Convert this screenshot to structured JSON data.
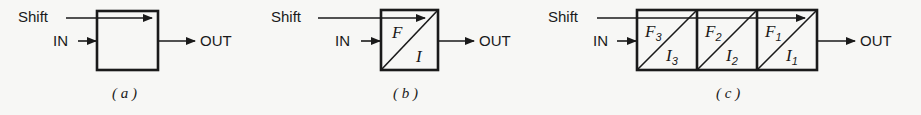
{
  "colors": {
    "ink": "#1a1a1a",
    "background": "#f7f7f5"
  },
  "panels": [
    {
      "id": "a",
      "caption": "( a )",
      "shift_label": "Shift",
      "in_label": "IN",
      "out_label": "OUT",
      "cells": []
    },
    {
      "id": "b",
      "caption": "( b )",
      "shift_label": "Shift",
      "in_label": "IN",
      "out_label": "OUT",
      "cells": [
        {
          "f": "F",
          "f_sub": "",
          "i": "I",
          "i_sub": ""
        }
      ]
    },
    {
      "id": "c",
      "caption": "( c )",
      "shift_label": "Shift",
      "in_label": "IN",
      "out_label": "OUT",
      "cells": [
        {
          "f": "F",
          "f_sub": "3",
          "i": "I",
          "i_sub": "3"
        },
        {
          "f": "F",
          "f_sub": "2",
          "i": "I",
          "i_sub": "2"
        },
        {
          "f": "F",
          "f_sub": "1",
          "i": "I",
          "i_sub": "1"
        }
      ]
    }
  ]
}
